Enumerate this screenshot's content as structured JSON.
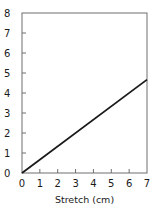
{
  "chart_data": {
    "type": "line",
    "title": "",
    "xlabel": "Stretch (cm)",
    "ylabel": "",
    "xlim": [
      0,
      7
    ],
    "ylim": [
      0,
      8
    ],
    "x_ticks": [
      "0",
      "1",
      "2",
      "3",
      "4",
      "5",
      "6",
      "7"
    ],
    "y_ticks": [
      "0",
      "1",
      "2",
      "3",
      "4",
      "5",
      "6",
      "7",
      "8"
    ],
    "grid": false,
    "legend": null,
    "series": [
      {
        "name": "line",
        "x": [
          0,
          7
        ],
        "y": [
          0,
          4.67
        ],
        "color": "#1a1a1a"
      }
    ]
  }
}
